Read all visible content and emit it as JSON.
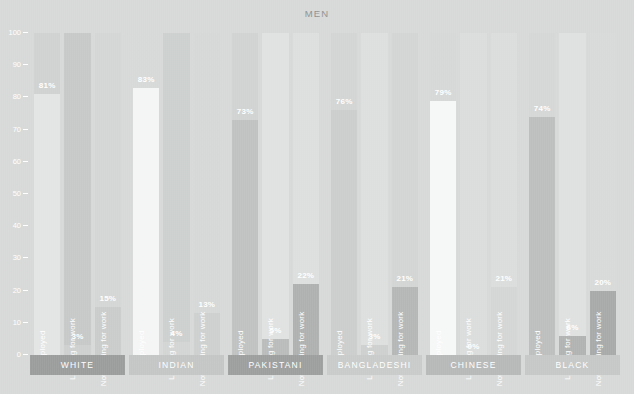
{
  "chart_data": {
    "type": "bar",
    "title": "MEN",
    "xlabel": "",
    "ylabel": "",
    "ylim": [
      0,
      100
    ],
    "yticks": [
      0,
      10,
      20,
      30,
      40,
      50,
      60,
      70,
      80,
      90,
      100
    ],
    "ytick_labels": [
      "0",
      "10",
      "20",
      "30",
      "40",
      "50",
      "60",
      "70",
      "80",
      "90",
      "100"
    ],
    "grid": false,
    "legend": "none",
    "value_suffix": "%",
    "categories": [
      "Employed",
      "Looking for work",
      "Not looking for work"
    ],
    "groups": [
      {
        "name": "WHITE",
        "band_color": "#9a9d9c",
        "bars": [
          {
            "label": "Employed",
            "value": 81,
            "value_label": "81%",
            "fill": "#e3e5e4",
            "track": "#cfd2d1"
          },
          {
            "label": "Looking for work",
            "value": 3,
            "value_label": "3%",
            "fill": "#cdd0cf",
            "track": "#c6c9c8"
          },
          {
            "label": "Not looking for work",
            "value": 15,
            "value_label": "15%",
            "fill": "#c9cccb",
            "track": "#d3d6d5"
          }
        ]
      },
      {
        "name": "INDIAN",
        "band_color": "#c3c6c5",
        "bars": [
          {
            "label": "Employed",
            "value": 83,
            "value_label": "83%",
            "fill": "#f4f5f5",
            "track": "#d6d9d8"
          },
          {
            "label": "Looking for work",
            "value": 4,
            "value_label": "4%",
            "fill": "#d2d5d4",
            "track": "#ccd0cf"
          },
          {
            "label": "Not looking for work",
            "value": 13,
            "value_label": "13%",
            "fill": "#cdd0cf",
            "track": "#d5d8d7"
          }
        ]
      },
      {
        "name": "PAKISTANI",
        "band_color": "#9c9f9e",
        "bars": [
          {
            "label": "Employed",
            "value": 73,
            "value_label": "73%",
            "fill": "#bfc2c1",
            "track": "#d0d3d2"
          },
          {
            "label": "Looking for work",
            "value": 5,
            "value_label": "5%",
            "fill": "#b9bcbb",
            "track": "#dfe2e1"
          },
          {
            "label": "Not looking for work",
            "value": 22,
            "value_label": "22%",
            "fill": "#aeb1b0",
            "track": "#dcdfde"
          }
        ]
      },
      {
        "name": "BANGLADESHI",
        "band_color": "#c8cbca",
        "bars": [
          {
            "label": "Employed",
            "value": 76,
            "value_label": "76%",
            "fill": "#cbcecd",
            "track": "#d2d5d4"
          },
          {
            "label": "Looking for work",
            "value": 3,
            "value_label": "3%",
            "fill": "#cdd0cf",
            "track": "#dcdfde"
          },
          {
            "label": "Not looking for work",
            "value": 21,
            "value_label": "21%",
            "fill": "#b4b7b6",
            "track": "#d2d5d4"
          }
        ]
      },
      {
        "name": "CHINESE",
        "band_color": "#b6b9b8",
        "bars": [
          {
            "label": "Employed",
            "value": 79,
            "value_label": "79%",
            "fill": "#f6f7f7",
            "track": "#d5d8d7"
          },
          {
            "label": "Looking for work",
            "value": 0,
            "value_label": "0%",
            "fill": "#d0d3d2",
            "track": "#dadddc"
          },
          {
            "label": "Not looking for work",
            "value": 21,
            "value_label": "21%",
            "fill": "#d3d6d5",
            "track": "#dadddc"
          }
        ]
      },
      {
        "name": "BLACK",
        "band_color": "#c5c8c7",
        "bars": [
          {
            "label": "Employed",
            "value": 74,
            "value_label": "74%",
            "fill": "#bcbfbe",
            "track": "#d4d7d6"
          },
          {
            "label": "Looking for work",
            "value": 6,
            "value_label": "6%",
            "fill": "#b0b3b2",
            "track": "#dee1e0"
          },
          {
            "label": "Not looking for work",
            "value": 20,
            "value_label": "20%",
            "fill": "#a7aaa9",
            "track": "#d7dad9"
          }
        ]
      }
    ]
  },
  "colors": {
    "background": "#d7d9d8",
    "axis_text": "#ffffff",
    "title_text": "#8e9190",
    "bar_text": "#ffffff"
  }
}
